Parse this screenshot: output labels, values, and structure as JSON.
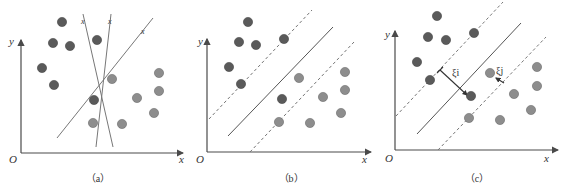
{
  "figure": {
    "colors": {
      "class_dark": "#5a5a5a",
      "class_light": "#8d8d8d",
      "axis": "#4a4a4a",
      "line": "#777777"
    },
    "panels": [
      {
        "id": "a",
        "caption": "（a）",
        "origin_label": "O",
        "x_label": "x",
        "y_label": "y",
        "line_labels": [
          "x",
          "x",
          "x"
        ],
        "description": "Three candidate separating lines (two steep, one diagonal) through two classes of points"
      },
      {
        "id": "b",
        "caption": "（b）",
        "origin_label": "O",
        "x_label": "x",
        "y_label": "y",
        "description": "Maximum-margin hyperplane (solid) with two dashed margin boundaries"
      },
      {
        "id": "c",
        "caption": "（c）",
        "origin_label": "O",
        "x_label": "x",
        "y_label": "y",
        "slack_labels": [
          "ξi",
          "ξj"
        ],
        "description": "Soft-margin hyperplane with slack variables ξ for points violating the margin"
      }
    ]
  }
}
